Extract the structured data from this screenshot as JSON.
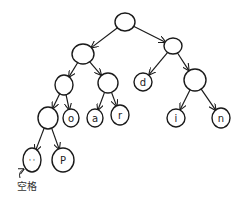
{
  "diagram": {
    "type": "binary-tree",
    "stroke_color": "#1a1a1a",
    "nodes": [
      {
        "id": "root",
        "label": "",
        "cx": 125,
        "cy": 22,
        "rx": 10,
        "ry": 9
      },
      {
        "id": "n_l",
        "label": "",
        "cx": 83,
        "cy": 54,
        "rx": 11,
        "ry": 10
      },
      {
        "id": "n_r",
        "label": "",
        "cx": 173,
        "cy": 46,
        "rx": 9,
        "ry": 8
      },
      {
        "id": "n_ll",
        "label": "",
        "cx": 64,
        "cy": 85,
        "rx": 9,
        "ry": 10
      },
      {
        "id": "n_lr",
        "label": "",
        "cx": 108,
        "cy": 83,
        "rx": 10,
        "ry": 10
      },
      {
        "id": "n_d",
        "label": "d",
        "cx": 143,
        "cy": 82,
        "rx": 9,
        "ry": 9
      },
      {
        "id": "n_rr",
        "label": "",
        "cx": 195,
        "cy": 80,
        "rx": 11,
        "ry": 11
      },
      {
        "id": "n_lll",
        "label": "",
        "cx": 48,
        "cy": 118,
        "rx": 10,
        "ry": 11
      },
      {
        "id": "n_o",
        "label": "o",
        "cx": 71,
        "cy": 118,
        "rx": 8,
        "ry": 9
      },
      {
        "id": "n_a",
        "label": "a",
        "cx": 95,
        "cy": 118,
        "rx": 8,
        "ry": 9
      },
      {
        "id": "n_r2",
        "label": "r",
        "cx": 120,
        "cy": 115,
        "rx": 9,
        "ry": 10
      },
      {
        "id": "n_i",
        "label": "i",
        "cx": 176,
        "cy": 118,
        "rx": 9,
        "ry": 9
      },
      {
        "id": "n_n",
        "label": "n",
        "cx": 221,
        "cy": 118,
        "rx": 9,
        "ry": 10
      },
      {
        "id": "n_space",
        "label": "' '",
        "cx": 32,
        "cy": 160,
        "rx": 9,
        "ry": 12
      },
      {
        "id": "n_p",
        "label": "P",
        "cx": 63,
        "cy": 160,
        "rx": 11,
        "ry": 12
      }
    ],
    "edges": [
      {
        "from": "root",
        "to": "n_l"
      },
      {
        "from": "root",
        "to": "n_r"
      },
      {
        "from": "n_l",
        "to": "n_ll"
      },
      {
        "from": "n_l",
        "to": "n_lr"
      },
      {
        "from": "n_r",
        "to": "n_d"
      },
      {
        "from": "n_r",
        "to": "n_rr"
      },
      {
        "from": "n_ll",
        "to": "n_lll"
      },
      {
        "from": "n_ll",
        "to": "n_o"
      },
      {
        "from": "n_lr",
        "to": "n_a"
      },
      {
        "from": "n_lr",
        "to": "n_r2"
      },
      {
        "from": "n_rr",
        "to": "n_i"
      },
      {
        "from": "n_rr",
        "to": "n_n"
      },
      {
        "from": "n_lll",
        "to": "n_space"
      },
      {
        "from": "n_lll",
        "to": "n_p"
      }
    ],
    "annotation": {
      "text": "空格",
      "target": "n_space",
      "x": 17,
      "y": 180
    }
  }
}
